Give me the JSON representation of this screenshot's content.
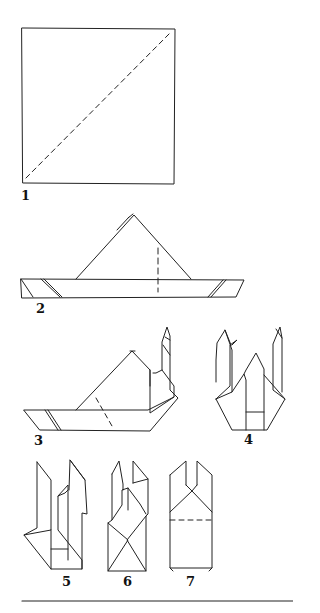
{
  "diagram": {
    "type": "origami folding instructions",
    "line_color": "#222222",
    "steps": [
      {
        "number": "1",
        "description": "square sheet with dashed diagonal fold line"
      },
      {
        "number": "2",
        "description": "folded into triangle with long band; dashed vertical fold line"
      },
      {
        "number": "3",
        "description": "right end of band folded up into a point"
      },
      {
        "number": "4",
        "description": "both ends folded up, forming two tall points"
      },
      {
        "number": "5",
        "description": "sides folded inward"
      },
      {
        "number": "6",
        "description": "further inward folds"
      },
      {
        "number": "7",
        "description": "finished form with dashed horizontal fold line"
      }
    ]
  }
}
